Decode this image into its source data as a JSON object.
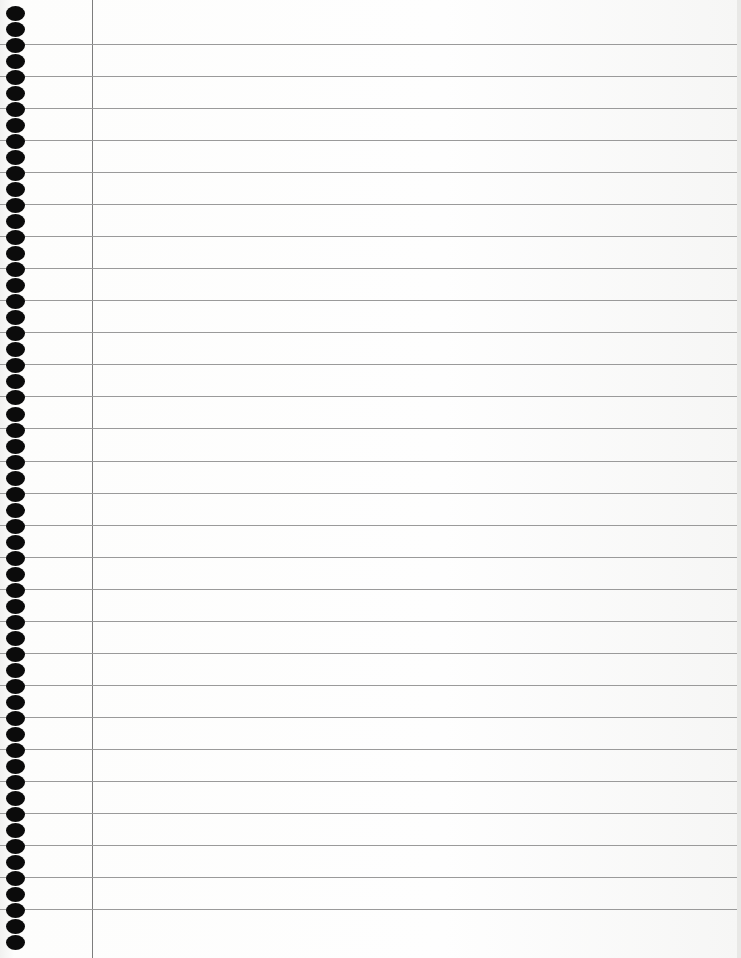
{
  "page": {
    "type": "lined notebook paper",
    "background_color": "#fbfbfa",
    "rule_color": "#9a9a9a",
    "margin_line_color": "#7d7d7d",
    "hole_color": "#0b0b0b"
  },
  "layout": {
    "rules": {
      "count": 28,
      "first_y": 44,
      "spacing": 32.04
    },
    "margin_line_x": 92,
    "holes": {
      "count": 59,
      "first_y": 6,
      "spacing": 16.02,
      "x": 6
    }
  }
}
